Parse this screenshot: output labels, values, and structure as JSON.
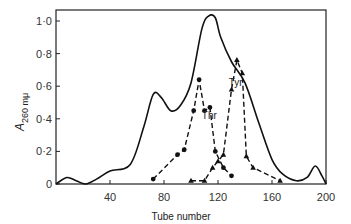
{
  "chart_data": {
    "type": "line",
    "title": "",
    "xlabel": "Tube number",
    "ylabel": "A260 mμ",
    "ylabel_main": "A",
    "ylabel_sub": "260 mμ",
    "xlim": [
      0,
      200
    ],
    "ylim": [
      0,
      1.05
    ],
    "xticks": [
      40,
      80,
      120,
      160,
      200
    ],
    "xtick_labels": [
      "40",
      "80",
      "120",
      "160",
      "200"
    ],
    "yticks": [
      0,
      0.2,
      0.4,
      0.6,
      0.8,
      1.0
    ],
    "ytick_labels": [
      "0",
      "0·2",
      "0·4",
      "0·6",
      "0·8",
      "1·0"
    ],
    "grid": false,
    "series": [
      {
        "name": "A260 (total)",
        "style": "solid",
        "marker": "none",
        "x": [
          0,
          8,
          15,
          22,
          30,
          40,
          55,
          65,
          72,
          78,
          85,
          92,
          100,
          108,
          113,
          118,
          122,
          130,
          140,
          150,
          160,
          168,
          178,
          186,
          192,
          197,
          200
        ],
        "y": [
          0.0,
          0.04,
          0.02,
          0.0,
          0.03,
          0.08,
          0.12,
          0.35,
          0.55,
          0.53,
          0.45,
          0.48,
          0.62,
          0.95,
          1.03,
          1.02,
          0.9,
          0.75,
          0.62,
          0.38,
          0.15,
          0.06,
          0.02,
          0.04,
          0.11,
          0.05,
          0.0
        ]
      },
      {
        "name": "Thr",
        "style": "dashed",
        "marker": "circle",
        "x": [
          72,
          90,
          95,
          102,
          106,
          110,
          114,
          118,
          124,
          130
        ],
        "y": [
          0.03,
          0.18,
          0.21,
          0.45,
          0.64,
          0.45,
          0.47,
          0.2,
          0.1,
          0.05
        ]
      },
      {
        "name": "Tyr",
        "style": "dashed",
        "marker": "triangle",
        "x": [
          100,
          110,
          116,
          120,
          124,
          130,
          134,
          138,
          141,
          146,
          166
        ],
        "y": [
          0.02,
          0.02,
          0.1,
          0.14,
          0.18,
          0.58,
          0.76,
          0.68,
          0.17,
          0.1,
          0.02
        ]
      }
    ],
    "annotations": [
      {
        "text": "Thr",
        "x": 108,
        "y": 0.4
      },
      {
        "text": "Tyr",
        "x": 128,
        "y": 0.6
      }
    ]
  }
}
